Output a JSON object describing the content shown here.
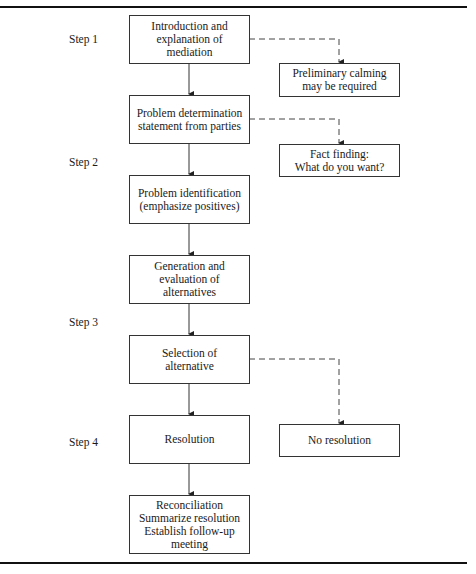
{
  "figure": {
    "steps": [
      {
        "label": "Step 1"
      },
      {
        "label": "Step 2"
      },
      {
        "label": "Step 3"
      },
      {
        "label": "Step 4"
      }
    ],
    "main_flow": [
      {
        "text": "Introduction and\nexplanation of\nmediation"
      },
      {
        "text": "Problem determination\nstatement from parties"
      },
      {
        "text": "Problem identification\n(emphasize positives)"
      },
      {
        "text": "Generation and\nevaluation of\nalternatives"
      },
      {
        "text": "Selection of\nalternative"
      },
      {
        "text": "Resolution"
      },
      {
        "text": "Reconciliation\nSummarize resolution\nEstablish follow-up\nmeeting"
      }
    ],
    "side_branches": [
      {
        "text": "Preliminary calming\nmay be required"
      },
      {
        "text": "Fact finding:\nWhat do you want?"
      },
      {
        "text": "No resolution"
      }
    ]
  }
}
